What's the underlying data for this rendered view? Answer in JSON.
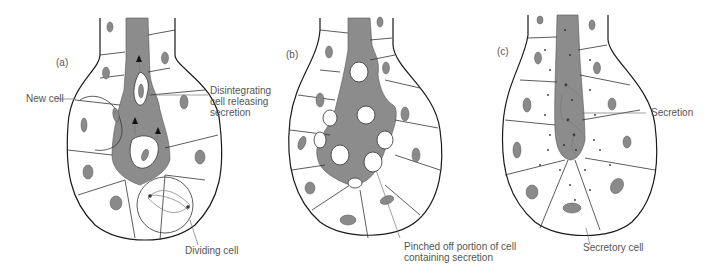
{
  "figure": {
    "colors": {
      "background": "#ffffff",
      "lumen": "#8c8c8c",
      "nucleus": "#8a8a8a",
      "outline": "#1a1a1a",
      "label_text": "#555555",
      "leader_line": "#777777"
    }
  },
  "panels": [
    {
      "id": "a",
      "tag": "(a)",
      "labels": [
        {
          "text": "New cell"
        },
        {
          "lines": [
            "Disintegrating",
            "cell releasing",
            "secretion"
          ]
        },
        {
          "text": "Dividing cell"
        }
      ]
    },
    {
      "id": "b",
      "tag": "(b)",
      "labels": [
        {
          "lines": [
            "Pinched off portion of cell",
            "containing secretion"
          ]
        }
      ]
    },
    {
      "id": "c",
      "tag": "(c)",
      "labels": [
        {
          "text": "Secretion"
        },
        {
          "text": "Secretory cell"
        }
      ]
    }
  ]
}
